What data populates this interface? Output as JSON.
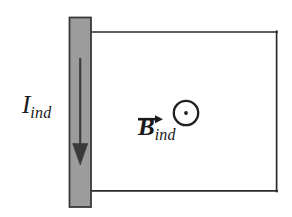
{
  "figure": {
    "background_color": "#ffffff",
    "stroke_color": "#2a2a2a",
    "bar_fill_color": "#9c9c9c",
    "bar_edge_color": "#3a3a3a",
    "loop": {
      "name": "circuit-loop",
      "left_x": 90,
      "right_x": 277,
      "top_y": 32,
      "bottom_y": 191,
      "stroke_width": 1.6
    },
    "conducting_bar": {
      "name": "conducting-bar",
      "x": 69,
      "y": 17,
      "width": 22,
      "height": 190,
      "fill": "#9c9c9c",
      "stroke": "#3a3a3a"
    },
    "current_arrow": {
      "name": "current-arrow",
      "direction": "down",
      "x": 80,
      "start_y": 58,
      "end_y": 165,
      "head_width": 15,
      "head_length": 20,
      "color": "#3a3a3a"
    },
    "field_symbol": {
      "name": "field-out-of-page-symbol",
      "glyph": "circle-dot",
      "meaning": "out of page",
      "center_x": 186,
      "center_y": 113,
      "radius": 12.5,
      "ring_width": 2.2,
      "dot_radius": 2.0
    }
  },
  "labels": {
    "current": {
      "name": "current-label",
      "base": "I",
      "subscript": "ind",
      "full_text": "I_ind",
      "meaning": "induced current"
    },
    "field": {
      "name": "magnetic-field-label",
      "base": "B",
      "subscript": "ind",
      "full_text": "B_ind",
      "vector": true,
      "meaning": "induced magnetic field"
    }
  }
}
